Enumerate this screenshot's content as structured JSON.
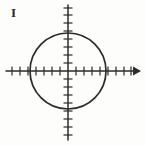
{
  "figure": {
    "label": "I",
    "caption_label": "I",
    "ink_color": "#2b2b2b",
    "background_color": "#fdfdfc",
    "style": "hand-drawn scanned math diagram"
  },
  "chart_data": {
    "type": "scatter",
    "title": "I",
    "xlabel": "",
    "ylabel": "",
    "grid": false,
    "legend": null,
    "axes": {
      "origin_px": [
        68,
        71
      ],
      "tick_spacing_px": 8,
      "x_axis": {
        "visible": true,
        "from_px": 6,
        "to_px": 140,
        "arrow_positive_end": true,
        "arrow_negative_end": false,
        "tick_count_negative": 7,
        "tick_count_positive": 8,
        "tick_length_px": 5,
        "range_units": [
          -7.5,
          9
        ]
      },
      "y_axis": {
        "visible": true,
        "from_px": 5,
        "to_px": 140,
        "arrow_positive_end": false,
        "arrow_negative_end": false,
        "tick_count_positive": 8,
        "tick_count_negative": 8,
        "tick_length_px": 5,
        "range_units": [
          -8.5,
          8
        ]
      }
    },
    "shapes": [
      {
        "kind": "circle",
        "center_units": [
          0,
          0
        ],
        "center_px": [
          68,
          71
        ],
        "radius_units": 4.75,
        "radius_px": 38,
        "x_intercepts_units": [
          -4.75,
          4.75
        ],
        "y_intercepts_units": [
          -4.75,
          4.75
        ],
        "bounds_px": {
          "left": 30,
          "right": 106,
          "top": 33,
          "bottom": 109
        },
        "filled": false,
        "stroke_color": "#2b2b2b",
        "stroke_width_px": 1.6
      }
    ],
    "tick_labels": {
      "x": [],
      "y": []
    },
    "annotations": [
      {
        "text": "I",
        "position_px": [
          11,
          6
        ],
        "role": "figure-label"
      }
    ]
  }
}
